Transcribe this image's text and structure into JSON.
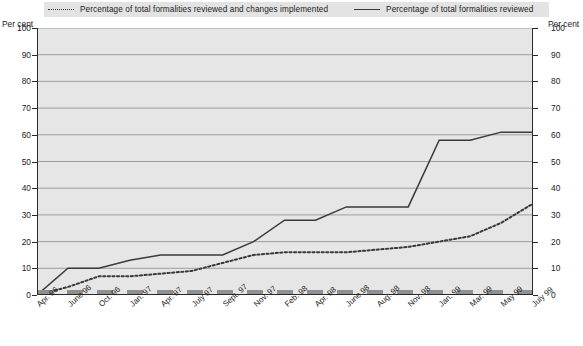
{
  "legend": {
    "items": [
      {
        "label": "Percentage of total formalities reviewed and changes implemented",
        "style": "dotted"
      },
      {
        "label": "Percentage of total formalities reviewed",
        "style": "solid"
      }
    ]
  },
  "axis": {
    "left_caption": "Per cent",
    "right_caption": "Per cent",
    "yticks": [
      "0",
      "10",
      "20",
      "30",
      "40",
      "50",
      "60",
      "70",
      "80",
      "90",
      "100"
    ]
  },
  "colors": {
    "plot_background": "#e6e6e6",
    "legend_background": "#e3e3e3",
    "gridline": "#8c8c8c",
    "series_solid": "#3a3a3a",
    "series_dotted": "#3a3a3a",
    "baseline_dash": "#8f8f8f",
    "axis": "#2a2a2a",
    "text": "#1b1b1b"
  },
  "chart_data": {
    "type": "line",
    "title": "",
    "xlabel": "",
    "ylabel": "Per cent",
    "ylim": [
      0,
      100
    ],
    "ytick_step": 10,
    "grid": true,
    "legend_position": "top",
    "categories": [
      "Apr. 96",
      "June 96",
      "Oct. 96",
      "Jan. 97",
      "Apr. 97",
      "July 97",
      "Sept. 97",
      "Nov. 97",
      "Feb. 98",
      "Apr. 98",
      "June 98",
      "Aug. 98",
      "Nov. 98",
      "Jan. 99",
      "Mar. 99",
      "May 99",
      "July 99"
    ],
    "series": [
      {
        "name": "Percentage of total formalities reviewed",
        "style": "solid",
        "values": [
          0,
          10,
          10,
          13,
          15,
          15,
          15,
          20,
          28,
          28,
          33,
          33,
          33,
          58,
          58,
          61,
          61
        ]
      },
      {
        "name": "Percentage of total formalities reviewed and changes implemented",
        "style": "dotted",
        "values": [
          0,
          3,
          7,
          7,
          8,
          9,
          12,
          15,
          16,
          16,
          16,
          17,
          18,
          20,
          22,
          27,
          34
        ]
      }
    ],
    "baseline_series": {
      "name": "zero-baseline",
      "style": "thick-dashed",
      "value": 0
    }
  }
}
